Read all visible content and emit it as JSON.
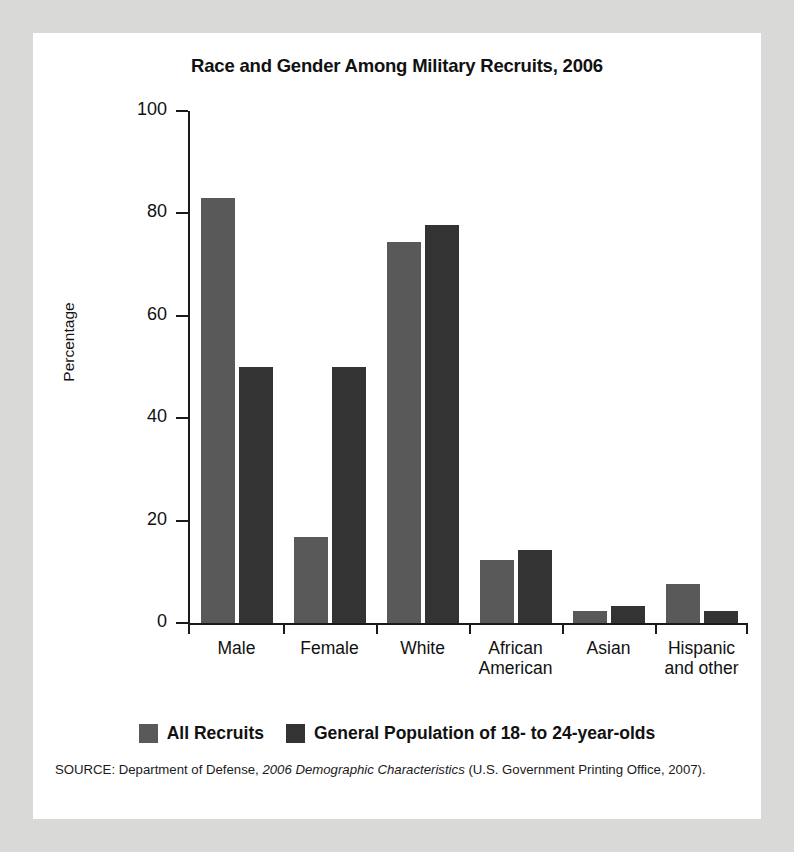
{
  "figure": {
    "title": "Race and Gender Among Military Recruits, 2006",
    "source_prefix": "SOURCE: Department of Defense, ",
    "source_italic": "2006 Demographic Characteristics",
    "source_suffix": " (U.S. Government Printing Office, 2007)."
  },
  "colors": {
    "page_background": "#d9d9d7",
    "card_background": "#ffffff",
    "series_all_recruits": "#595959",
    "series_general_population": "#333333",
    "axis": "#1a1a1a",
    "text": "#111111"
  },
  "chart_data": {
    "type": "bar",
    "title": "Race and Gender Among Military Recruits, 2006",
    "xlabel": "",
    "ylabel": "Percentage",
    "ylim": [
      0,
      100
    ],
    "yticks": [
      0,
      20,
      40,
      60,
      80,
      100
    ],
    "ytick_labels": [
      "0",
      "20",
      "40",
      "60",
      "80",
      "100"
    ],
    "grid": false,
    "legend_position": "bottom",
    "categories": [
      "Male",
      "Female",
      "White",
      "African American",
      "Asian",
      "Hispanic and other"
    ],
    "category_lines": [
      [
        "Male"
      ],
      [
        "Female"
      ],
      [
        "White"
      ],
      [
        "African",
        "American"
      ],
      [
        "Asian"
      ],
      [
        "Hispanic",
        "and other"
      ]
    ],
    "series": [
      {
        "name": "All Recruits",
        "color": "#595959",
        "values": [
          83,
          16.8,
          74.5,
          12.3,
          2.3,
          7.6
        ]
      },
      {
        "name": "General Population of 18- to 24-year-olds",
        "color": "#333333",
        "values": [
          50,
          50,
          77.8,
          14.2,
          3.3,
          2.3
        ]
      }
    ]
  }
}
